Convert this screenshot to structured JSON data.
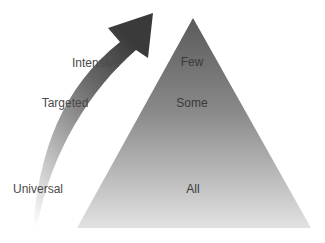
{
  "diagram": {
    "type": "pyramid-with-arrow",
    "arrow": {
      "direction": "up-right",
      "color_top": "#3c3c3c",
      "color_bottom": "#f2f2f2"
    },
    "arrow_labels": [
      {
        "text": "Intensive"
      },
      {
        "text": "Targeted"
      },
      {
        "text": "Universal"
      }
    ],
    "pyramid": {
      "color_top": "#5a5a5a",
      "color_bottom": "#e0e0e0",
      "levels": [
        {
          "text": "Few"
        },
        {
          "text": "Some"
        },
        {
          "text": "All"
        }
      ]
    }
  }
}
